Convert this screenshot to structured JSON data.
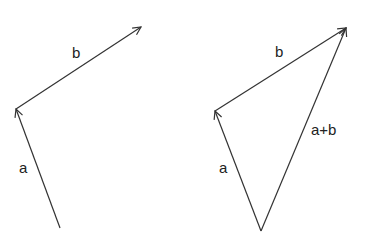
{
  "figures": [
    {
      "name": "vectors-separate",
      "labels": {
        "a": "a",
        "b": "b"
      }
    },
    {
      "name": "vector-sum-triangle",
      "labels": {
        "a": "a",
        "b": "b",
        "sum": "a+b"
      }
    }
  ],
  "colors": {
    "stroke": "#333333",
    "text": "#222222"
  }
}
